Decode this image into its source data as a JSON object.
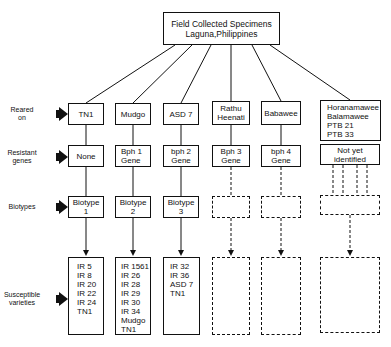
{
  "root": {
    "line1": "Field Collected Specimens",
    "line2": "Laguna,Philippines"
  },
  "row_labels": {
    "reared": [
      "Reared",
      "on"
    ],
    "genes": [
      "Resistant",
      "genes"
    ],
    "biotypes": [
      "Biotypes"
    ],
    "susceptible": [
      "Susceptible",
      "varieties"
    ]
  },
  "columns": [
    {
      "reared": [
        "TN1"
      ],
      "gene": [
        "None"
      ],
      "biotype": [
        "Biotype",
        "1"
      ],
      "susceptible": [
        "IR 5",
        "IR 8",
        "IR 20",
        "IR 22",
        "IR 24",
        "TN1"
      ]
    },
    {
      "reared": [
        "Mudgo"
      ],
      "gene": [
        "Bph 1",
        "Gene"
      ],
      "biotype": [
        "Biotype",
        "2"
      ],
      "susceptible": [
        "IR 1561",
        "IR 26",
        "IR 28",
        "IR 29",
        "IR 30",
        "IR 34",
        "Mudgo",
        "TN1"
      ]
    },
    {
      "reared": [
        "ASD 7"
      ],
      "gene": [
        "bph 2",
        "Gene"
      ],
      "biotype": [
        "Biotype",
        "3"
      ],
      "susceptible": [
        "IR 32",
        "IR 36",
        "ASD 7",
        "TN1"
      ]
    },
    {
      "reared": [
        "Rathu",
        "Heenati"
      ],
      "gene": [
        "Bph 3",
        "Gene"
      ],
      "biotype": [],
      "susceptible": []
    },
    {
      "reared": [
        "Babawee"
      ],
      "gene": [
        "bph 4",
        "Gene"
      ],
      "biotype": [],
      "susceptible": []
    },
    {
      "reared": [
        "Horanamawee",
        "Balamawee",
        "PTB 21",
        "PTB 33"
      ],
      "gene": [
        "Not yet",
        "identified"
      ],
      "biotype": [],
      "susceptible": []
    }
  ]
}
